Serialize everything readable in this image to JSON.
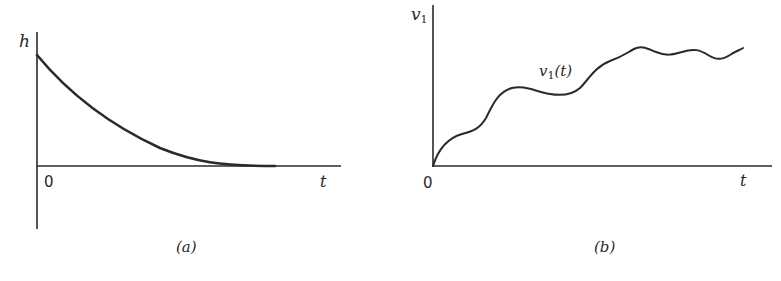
{
  "figure": {
    "panels": [
      {
        "id": "a",
        "caption": "(a)",
        "y_axis_label": "h",
        "x_axis_label": "t",
        "origin_label": "0",
        "curve_description": "exponential decay from a positive initial value toward zero"
      },
      {
        "id": "b",
        "caption": "(b)",
        "y_axis_label_main": "v",
        "y_axis_label_sub": "1",
        "x_axis_label": "t",
        "origin_label": "0",
        "curve_label_main": "v",
        "curve_label_sub": "1",
        "curve_label_arg": "(t)",
        "curve_description": "wavy rising function starting at origin, increasing with oscillations"
      }
    ],
    "colors": {
      "ink": "#2a2a2a",
      "background": "#ffffff"
    }
  }
}
